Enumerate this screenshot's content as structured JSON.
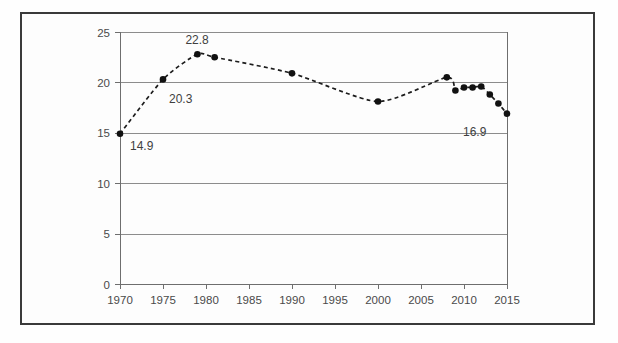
{
  "figure": {
    "name": "line-chart-figure",
    "background": "#fefefe",
    "border_color": "#3a3a3a"
  },
  "chart_data": {
    "type": "line",
    "title": "",
    "subtitle": "",
    "xlabel": "",
    "ylabel": "",
    "xlim": [
      1970,
      2015
    ],
    "ylim": [
      0,
      25
    ],
    "grid": true,
    "legend": null,
    "legend_position": "none",
    "line_style": "dashed",
    "line_color": "#1c1c1c",
    "marker": "circle",
    "marker_color": "#111111",
    "xticks": [
      1970,
      1975,
      1980,
      1985,
      1990,
      1995,
      2000,
      2005,
      2010,
      2015
    ],
    "xtick_labels": [
      "1970",
      "1975",
      "1980",
      "1985",
      "1990",
      "1995",
      "2000",
      "2005",
      "2010",
      "2015"
    ],
    "yticks": [
      0,
      5,
      10,
      15,
      20,
      25
    ],
    "ytick_labels": [
      "0",
      "5",
      "10",
      "15",
      "20",
      "25"
    ],
    "x": [
      1970,
      1975,
      1979,
      1981,
      1990,
      2000,
      2008,
      2009,
      2010,
      2011,
      2012,
      2013,
      2014,
      2015
    ],
    "values": [
      14.9,
      20.3,
      22.8,
      22.5,
      20.9,
      18.1,
      20.5,
      19.2,
      19.5,
      19.5,
      19.6,
      18.8,
      17.9,
      16.9
    ],
    "marker_points": [
      {
        "x": 1970,
        "y": 14.9
      },
      {
        "x": 1975,
        "y": 20.3
      },
      {
        "x": 1979,
        "y": 22.8
      },
      {
        "x": 1981,
        "y": 22.5
      },
      {
        "x": 1990,
        "y": 20.9
      },
      {
        "x": 2000,
        "y": 18.1
      },
      {
        "x": 2008,
        "y": 20.5
      },
      {
        "x": 2009,
        "y": 19.2
      },
      {
        "x": 2010,
        "y": 19.5
      },
      {
        "x": 2011,
        "y": 19.5
      },
      {
        "x": 2012,
        "y": 19.6
      },
      {
        "x": 2013,
        "y": 18.8
      },
      {
        "x": 2014,
        "y": 17.9
      },
      {
        "x": 2015,
        "y": 16.9
      }
    ],
    "annotations": [
      {
        "text": "14.9",
        "x": 1970,
        "y": 14.9,
        "dx": 10,
        "dy": 16
      },
      {
        "text": "20.3",
        "x": 1975,
        "y": 20.3,
        "dx": 6,
        "dy": 24
      },
      {
        "text": "22.8",
        "x": 1979,
        "y": 22.8,
        "dx": -12,
        "dy": -10
      },
      {
        "text": "16.9",
        "x": 2015,
        "y": 16.9,
        "dx": -44,
        "dy": 22
      }
    ]
  },
  "axis": {
    "y_tick_0": "0",
    "y_tick_1": "5",
    "y_tick_2": "10",
    "y_tick_3": "15",
    "y_tick_4": "20",
    "y_tick_5": "25",
    "x_tick_0": "1970",
    "x_tick_1": "1975",
    "x_tick_2": "1980",
    "x_tick_3": "1985",
    "x_tick_4": "1990",
    "x_tick_5": "1995",
    "x_tick_6": "2000",
    "x_tick_7": "2005",
    "x_tick_8": "2010",
    "x_tick_9": "2015"
  },
  "labels": {
    "annotation_0": "14.9",
    "annotation_1": "20.3",
    "annotation_2": "22.8",
    "annotation_3": "16.9"
  }
}
